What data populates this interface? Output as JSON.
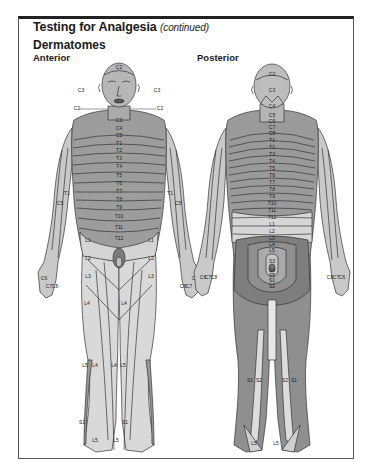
{
  "header": {
    "title": "Testing for Analgesia",
    "title_suffix": "(continued)",
    "subtitle": "Dermatomes"
  },
  "views": {
    "anterior": {
      "label": "Anterior",
      "head_labels": {
        "vertex": "C2",
        "cheek_left": "C3",
        "cheek_right": "C3",
        "jaw_left": "C2",
        "jaw_right": "C2"
      },
      "neck_labels": [
        "C3",
        "C4",
        "C5"
      ],
      "trunk_labels": [
        "T1",
        "T2",
        "T3",
        "T4",
        "T5",
        "T6",
        "T7",
        "T8",
        "T9",
        "T10",
        "T11",
        "T12"
      ],
      "arm_labels": {
        "upper_left": "C5",
        "upper_right": "C5",
        "lower_left": "T1",
        "lower_right": "T1",
        "hand_left": [
          "C6",
          "C7",
          "C8"
        ],
        "hand_right": [
          "C8",
          "C7",
          "C6"
        ]
      },
      "leg_labels": {
        "groin": [
          "L1",
          "L1"
        ],
        "thigh_upper": [
          "L2",
          "L2"
        ],
        "thigh_lower": [
          "L3",
          "L3"
        ],
        "knee": [
          "L4",
          "L4"
        ],
        "shin": [
          "L5",
          "L4",
          "L4",
          "L5"
        ],
        "ankle": [
          "S1",
          "S1"
        ],
        "foot": [
          "L5",
          "L5"
        ]
      }
    },
    "posterior": {
      "label": "Posterior",
      "head_labels": [
        "C2",
        "C3",
        "C4"
      ],
      "spine_labels": [
        "C5",
        "C6",
        "C7",
        "C8",
        "T1",
        "T2",
        "T3",
        "T4",
        "T5",
        "T6",
        "T7",
        "T8",
        "T9",
        "T10",
        "T11",
        "T12",
        "L1",
        "L2",
        "L3",
        "L4",
        "L5",
        "S1",
        "S2",
        "S3",
        "S4",
        "S5"
      ],
      "hand_left": [
        "C6",
        "C7",
        "C8"
      ],
      "hand_right": [
        "C8",
        "C7",
        "C6"
      ],
      "calf_labels": [
        "S1",
        "S2",
        "S2",
        "S1"
      ],
      "foot_labels": [
        "L5",
        "L5"
      ]
    }
  },
  "colors": {
    "skin_light": "#d9d9d9",
    "skin_mid": "#b9b9b9",
    "skin_dark": "#8f8f8f",
    "outline": "#333333"
  }
}
